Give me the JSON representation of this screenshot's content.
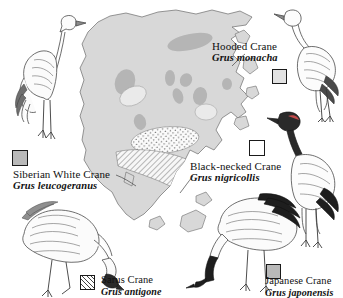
{
  "plate": {
    "title": "Asian Crane Species Distribution Map",
    "background_color": "#ffffff",
    "map_land_color": "#d6d6d6",
    "map_outline_color": "#5a5a5a",
    "range_blob_color": "#b0b0b0"
  },
  "species": [
    {
      "id": "siberian-white-crane",
      "common_name": "Siberian White Crane",
      "scientific_name": "Grus leucogeranus",
      "swatch_pattern": "solid-gray",
      "swatch_color": "#b9b9b9",
      "label_position": "left-middle"
    },
    {
      "id": "hooded-crane",
      "common_name": "Hooded Crane",
      "scientific_name": "Grus monacha",
      "swatch_pattern": "light-gray",
      "swatch_color": "#e2e2e2",
      "label_position": "top-right"
    },
    {
      "id": "black-necked-crane",
      "common_name": "Black-necked Crane",
      "scientific_name": "Grus nigricollis",
      "swatch_pattern": "dotted",
      "swatch_color": "#ffffff",
      "label_position": "right-middle"
    },
    {
      "id": "sarus-crane",
      "common_name": "Sarus Crane",
      "scientific_name": "Grus antigone",
      "swatch_pattern": "diagonal-hatch",
      "swatch_color": "#ffffff",
      "label_position": "bottom-left"
    },
    {
      "id": "japanese-crane",
      "common_name": "Japanese Crane",
      "scientific_name": "Grus japonensis",
      "swatch_pattern": "solid-gray",
      "swatch_color": "#b9b9b9",
      "label_position": "bottom-right"
    }
  ],
  "illustrations": [
    {
      "id": "illustration-siberian-white-crane",
      "pose": "standing-upright",
      "position": "top-left"
    },
    {
      "id": "illustration-hooded-crane",
      "pose": "standing-preening",
      "position": "top-right"
    },
    {
      "id": "illustration-black-necked-crane",
      "pose": "standing-upright",
      "position": "right"
    },
    {
      "id": "illustration-sarus-crane",
      "pose": "head-down-foraging",
      "position": "bottom-left"
    },
    {
      "id": "illustration-japanese-crane",
      "pose": "head-down-foraging",
      "position": "bottom-center"
    }
  ],
  "map_ranges": [
    {
      "id": "range-siberian-white-crane",
      "pattern": "solid-gray",
      "region": "Siberia / northern Asia patches"
    },
    {
      "id": "range-black-necked-crane",
      "pattern": "dotted",
      "region": "Tibetan Plateau"
    },
    {
      "id": "range-sarus-crane",
      "pattern": "diagonal-hatch",
      "region": "India and Southeast Asia"
    },
    {
      "id": "range-hooded-crane",
      "pattern": "light-gray",
      "region": "East Asia"
    }
  ]
}
